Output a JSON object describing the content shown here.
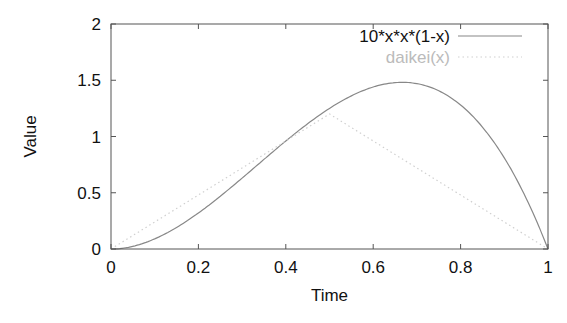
{
  "chart_data": {
    "type": "line",
    "title": "",
    "xlabel": "Time",
    "ylabel": "Value",
    "xlim": [
      0,
      1
    ],
    "ylim": [
      0,
      2
    ],
    "xticks": [
      "0",
      "0.2",
      "0.4",
      "0.6",
      "0.8",
      "1"
    ],
    "yticks": [
      "0",
      "0.5",
      "1",
      "1.5",
      "2"
    ],
    "grid": false,
    "legend_position": "top-right",
    "series": [
      {
        "name": "10*x*x*(1-x)",
        "color": "#888888",
        "style": "solid",
        "x": [
          0,
          0.1,
          0.2,
          0.3,
          0.4,
          0.5,
          0.6,
          0.6667,
          0.7,
          0.8,
          0.9,
          1.0
        ],
        "y": [
          0,
          0.09,
          0.32,
          0.63,
          0.96,
          1.25,
          1.44,
          1.48,
          1.47,
          1.28,
          0.81,
          0
        ]
      },
      {
        "name": "daikei(x)",
        "color": "#d0d0d0",
        "style": "dotted",
        "x": [
          0,
          0.5,
          1.0
        ],
        "y": [
          0,
          1.2,
          0
        ]
      }
    ]
  }
}
